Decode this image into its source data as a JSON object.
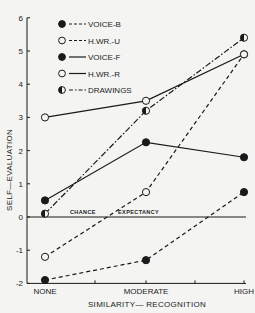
{
  "chart_data": {
    "type": "line",
    "title": "",
    "xlabel": "SIMILARITY— RECOGNITION",
    "ylabel": "SELF—EVALUATION",
    "categories": [
      "NONE",
      "MODERATE",
      "HIGH"
    ],
    "ylim": [
      -2,
      6
    ],
    "yticks": [
      -2,
      -1,
      0,
      1,
      2,
      3,
      4,
      5,
      6
    ],
    "ytick_labels": [
      "-2",
      "-1",
      "0",
      "1",
      "2",
      "3",
      "4",
      "5",
      "6"
    ],
    "grid": false,
    "legend_position": "top-left",
    "reference_line": {
      "value": 0,
      "label_left": "CHANCE",
      "label_right": "EXPECTANCY"
    },
    "series": [
      {
        "name": "VOICE-B",
        "marker": "filled",
        "line": "dashed",
        "values": [
          -1.9,
          -1.3,
          0.75
        ]
      },
      {
        "name": "H.WR.-U",
        "marker": "open",
        "line": "dashed",
        "values": [
          -1.2,
          0.75,
          4.9
        ]
      },
      {
        "name": "VOICE-F",
        "marker": "filled",
        "line": "solid",
        "values": [
          0.5,
          2.25,
          1.8
        ]
      },
      {
        "name": "H.WR.-R",
        "marker": "open",
        "line": "solid",
        "values": [
          3.0,
          3.5,
          4.9
        ]
      },
      {
        "name": "DRAWINGS",
        "marker": "half",
        "line": "dashdot",
        "values": [
          0.1,
          3.2,
          5.4
        ]
      }
    ]
  }
}
